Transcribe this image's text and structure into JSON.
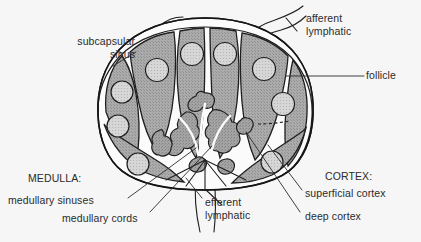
{
  "figure": {
    "background_color": "#f6f6f6",
    "ink_color": "#2b2b2b"
  },
  "labels": {
    "subcapsular_sinus_line1": "subcapsular",
    "subcapsular_sinus_line2": "sinus",
    "afferent_lymphatic_line1": "afferent",
    "afferent_lymphatic_line2": "lymphatic",
    "follicle": "follicle",
    "cortex_header": "CORTEX:",
    "superficial_cortex": "superficial cortex",
    "deep_cortex": "deep cortex",
    "medulla_header": "MEDULLA:",
    "medullary_sinuses": "medullary sinuses",
    "medullary_cords": "medullary cords",
    "efferent_lymphatic_line1": "efferent",
    "efferent_lymphatic_line2": "lymphatic"
  },
  "anatomy": {
    "capsule_color": "#1c1c1c",
    "cortex_fill": "#a8a8a8",
    "follicle_fill": "#d2d2d2",
    "sinus_fill": "#fbfbfb",
    "medulla_cord_fill": "#9e9e9e",
    "follicle_count": 9,
    "cortical_lobule_count": 6,
    "structures": [
      "capsule",
      "subcapsular sinus",
      "superficial cortex",
      "deep cortex",
      "follicle",
      "medullary cord",
      "medullary sinus",
      "afferent lymphatic vessel",
      "efferent lymphatic vessel",
      "hilum"
    ]
  }
}
